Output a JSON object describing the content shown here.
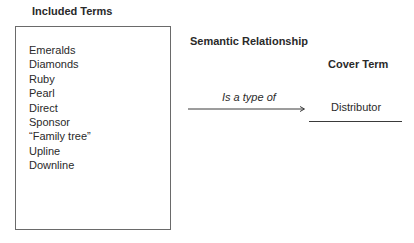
{
  "included_terms": {
    "heading": "Included Terms",
    "items": [
      "Emeralds",
      "Diamonds",
      "Ruby",
      "Pearl",
      "Direct",
      "Sponsor",
      "“Family tree”",
      "Upline",
      "Downline"
    ]
  },
  "semantic_relationship": {
    "heading": "Semantic Relationship",
    "label": "Is a type of",
    "arrow_icon": "right-arrow"
  },
  "cover_term": {
    "heading": "Cover Term",
    "value": "Distributor"
  }
}
